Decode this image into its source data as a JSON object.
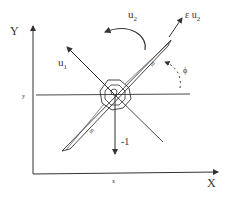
{
  "diagram": {
    "type": "PVTOL aircraft free-body diagram",
    "axes": {
      "x_axis_label": "X",
      "y_axis_label": "Y",
      "x_tick_label": "x",
      "y_tick_label": "y"
    },
    "labels": {
      "u1": "u",
      "u1_sub": "1",
      "u2": "u",
      "u2_sub": "2",
      "eps_u2": "ε u",
      "eps_u2_sub": "2",
      "gravity": "-1",
      "angle": "ϕ",
      "mass_left": "m",
      "mass_right": "m"
    },
    "colors": {
      "line": "#333333",
      "background": "#ffffff"
    }
  }
}
